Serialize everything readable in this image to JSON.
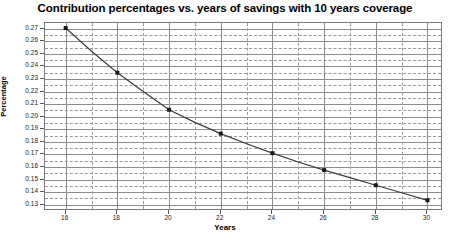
{
  "chart_data": {
    "type": "line",
    "title": "Contribution percentages vs. years of savings with 10 years coverage",
    "xlabel": "Years",
    "ylabel": "Percentage",
    "xlim": [
      15.2,
      30.6
    ],
    "ylim": [
      0.125,
      0.2745
    ],
    "xticks": [
      16,
      18,
      20,
      22,
      24,
      26,
      28,
      30
    ],
    "xtick_labels": [
      "16",
      "18",
      "20",
      "22",
      "24",
      "26",
      "28",
      "30"
    ],
    "x_minor_step": 1,
    "yticks": [
      0.13,
      0.14,
      0.15,
      0.16,
      0.17,
      0.18,
      0.19,
      0.2,
      0.21,
      0.22,
      0.23,
      0.24,
      0.25,
      0.26,
      0.27
    ],
    "ytick_labels": [
      "0.13",
      "0.14",
      "0.15",
      "0.16",
      "0.17",
      "0.18",
      "0.19",
      "0.20",
      "0.21",
      "0.22",
      "0.23",
      "0.24",
      "0.25",
      "0.26",
      "0.27"
    ],
    "y_minor_count": 1,
    "grid": true,
    "grid_major_style": "solid",
    "grid_minor_style": "dashed",
    "legend": false,
    "line_color": "#3b3b3b",
    "marker": "square",
    "marker_color": "#1a1a1a",
    "x": [
      16,
      17,
      18,
      19,
      20,
      21,
      22,
      23,
      24,
      25,
      26,
      27,
      28,
      29,
      30
    ],
    "values": [
      0.2705,
      0.252,
      0.235,
      0.22,
      0.2055,
      0.1955,
      0.1865,
      0.1785,
      0.171,
      0.164,
      0.1575,
      0.1515,
      0.1455,
      0.1395,
      0.1335
    ],
    "series": [
      {
        "name": "Contribution percentage",
        "x": [
          16,
          17,
          18,
          19,
          20,
          21,
          22,
          23,
          24,
          25,
          26,
          27,
          28,
          29,
          30
        ],
        "values": [
          0.2705,
          0.252,
          0.235,
          0.22,
          0.2055,
          0.1955,
          0.1865,
          0.1785,
          0.171,
          0.164,
          0.1575,
          0.1515,
          0.1455,
          0.1395,
          0.1335
        ],
        "marker_x": [
          16,
          18,
          20,
          22,
          24,
          26,
          28,
          30
        ],
        "marker_values": [
          0.2705,
          0.235,
          0.2055,
          0.1865,
          0.171,
          0.1575,
          0.1455,
          0.1335
        ]
      }
    ]
  }
}
